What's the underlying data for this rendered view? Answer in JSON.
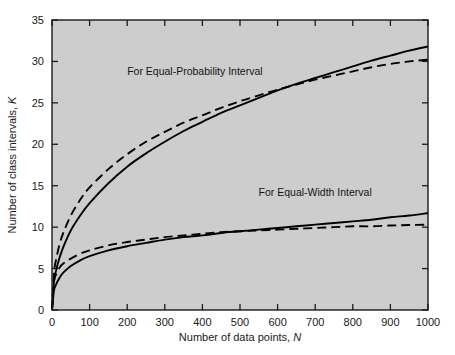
{
  "figure": {
    "plot_background_color": "#cdcdcd",
    "page_background_color": "#ffffff",
    "axis_color": "#1a1a1a",
    "curve_color": "#000000"
  },
  "chart_data": {
    "type": "line",
    "title": "",
    "subtitle": "",
    "xlabel": "Number of data points,",
    "xlabel_symbol": "N",
    "ylabel": "Number of class intervals,",
    "ylabel_symbol": "K",
    "xlim": [
      0,
      1000
    ],
    "ylim": [
      0,
      35
    ],
    "xticks": [
      0,
      100,
      200,
      300,
      400,
      500,
      600,
      700,
      800,
      900,
      1000
    ],
    "xtick_labels": [
      "0",
      "100",
      "200",
      "300",
      "400",
      "500",
      "600",
      "700",
      "800",
      "900",
      "1000"
    ],
    "yticks": [
      0,
      5,
      10,
      15,
      20,
      25,
      30,
      35
    ],
    "ytick_labels": [
      "0",
      "5",
      "10",
      "15",
      "20",
      "25",
      "30",
      "35"
    ],
    "grid": false,
    "legend_position": "inline-annotations",
    "annotations": [
      {
        "text": "For Equal-Probability Interval",
        "x": 380,
        "y": 28.4
      },
      {
        "text": "For Equal-Width Interval",
        "x": 700,
        "y": 13.8
      }
    ],
    "series": [
      {
        "name": "Equal-Probability Interval (solid)",
        "style": "solid",
        "group": "equal-probability",
        "x": [
          0,
          5,
          10,
          20,
          30,
          50,
          75,
          100,
          150,
          200,
          250,
          300,
          350,
          400,
          450,
          500,
          550,
          600,
          650,
          700,
          750,
          800,
          850,
          900,
          950,
          1000
        ],
        "y": [
          0.0,
          3.3,
          4.6,
          6.3,
          7.6,
          9.6,
          11.4,
          12.9,
          15.3,
          17.3,
          18.9,
          20.3,
          21.6,
          22.7,
          23.8,
          24.7,
          25.6,
          26.5,
          27.3,
          28.0,
          28.7,
          29.4,
          30.1,
          30.7,
          31.3,
          31.8
        ]
      },
      {
        "name": "Equal-Probability Interval (dashed)",
        "style": "dashed",
        "group": "equal-probability",
        "x": [
          0,
          5,
          10,
          20,
          30,
          50,
          75,
          100,
          150,
          200,
          250,
          300,
          350,
          400,
          450,
          500,
          550,
          600,
          650,
          700,
          750,
          800,
          850,
          900,
          950,
          1000
        ],
        "y": [
          0.0,
          4.3,
          5.9,
          7.9,
          9.3,
          11.4,
          13.3,
          14.8,
          17.0,
          18.8,
          20.3,
          21.5,
          22.6,
          23.5,
          24.4,
          25.2,
          25.9,
          26.6,
          27.2,
          27.8,
          28.3,
          28.8,
          29.3,
          29.7,
          30.0,
          30.2
        ]
      },
      {
        "name": "Equal-Width Interval (solid)",
        "style": "solid",
        "group": "equal-width",
        "x": [
          0,
          5,
          10,
          20,
          30,
          50,
          75,
          100,
          150,
          200,
          250,
          300,
          350,
          400,
          450,
          500,
          550,
          600,
          650,
          700,
          750,
          800,
          850,
          900,
          950,
          1000
        ],
        "y": [
          0.0,
          2.3,
          3.0,
          3.9,
          4.5,
          5.3,
          6.0,
          6.5,
          7.2,
          7.7,
          8.1,
          8.5,
          8.8,
          9.0,
          9.3,
          9.5,
          9.7,
          9.9,
          10.1,
          10.3,
          10.5,
          10.7,
          10.9,
          11.2,
          11.4,
          11.7
        ]
      },
      {
        "name": "Equal-Width Interval (dashed)",
        "style": "dashed",
        "group": "equal-width",
        "x": [
          0,
          5,
          10,
          20,
          30,
          50,
          75,
          100,
          150,
          200,
          250,
          300,
          350,
          400,
          450,
          500,
          550,
          600,
          650,
          700,
          750,
          800,
          850,
          900,
          950,
          1000
        ],
        "y": [
          0.0,
          3.3,
          4.2,
          5.1,
          5.6,
          6.2,
          6.8,
          7.2,
          7.8,
          8.2,
          8.5,
          8.8,
          9.0,
          9.2,
          9.4,
          9.5,
          9.6,
          9.7,
          9.8,
          9.9,
          10.0,
          10.1,
          10.1,
          10.2,
          10.25,
          10.3
        ]
      }
    ]
  }
}
